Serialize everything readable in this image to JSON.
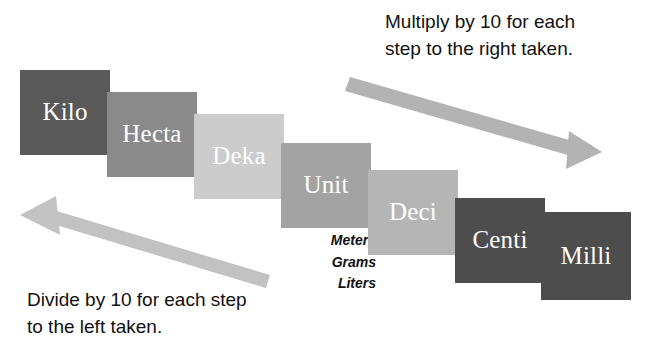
{
  "diagram": {
    "background": "#ffffff",
    "steps": [
      {
        "label": "Kilo",
        "color": "#595959",
        "text_color": "#ffffff",
        "x": 20,
        "y": 70,
        "w": 90,
        "h": 85,
        "factor": 1000
      },
      {
        "label": "Hecta",
        "color": "#8a8a8a",
        "text_color": "#ffffff",
        "x": 107,
        "y": 92,
        "w": 90,
        "h": 85,
        "factor": 100
      },
      {
        "label": "Deka",
        "color": "#cccccc",
        "text_color": "#ffffff",
        "x": 194,
        "y": 114,
        "w": 90,
        "h": 85,
        "factor": 10
      },
      {
        "label": "Unit",
        "color": "#a3a3a3",
        "text_color": "#ffffff",
        "x": 281,
        "y": 143,
        "w": 90,
        "h": 85,
        "factor": 1
      },
      {
        "label": "Deci",
        "color": "#b5b5b5",
        "text_color": "#ffffff",
        "x": 368,
        "y": 170,
        "w": 90,
        "h": 85,
        "factor": 0.1
      },
      {
        "label": "Centi",
        "color": "#4d4d4d",
        "text_color": "#ffffff",
        "x": 455,
        "y": 198,
        "w": 90,
        "h": 85,
        "factor": 0.01
      },
      {
        "label": "Milli",
        "color": "#4d4d4d",
        "text_color": "#ffffff",
        "x": 541,
        "y": 212,
        "w": 90,
        "h": 88,
        "factor": 0.001
      }
    ],
    "base_units": [
      "Meters",
      "Grams",
      "Liters"
    ],
    "notes": {
      "right": {
        "line1": "Multiply by 10 for each",
        "line2": "step to the right taken."
      },
      "left": {
        "line1": "Divide by 10 for each step",
        "line2": "to the left taken."
      }
    },
    "arrows": {
      "right": {
        "name": "multiply-arrow-right",
        "color": "#b3b3b3",
        "direction": "down-right"
      },
      "left": {
        "name": "divide-arrow-left",
        "color": "#c2c2c2",
        "direction": "up-left"
      }
    }
  }
}
